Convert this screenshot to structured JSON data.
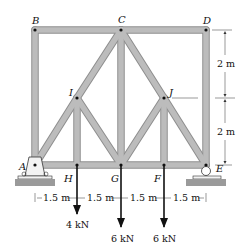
{
  "figure": {
    "type": "truss",
    "member_color": "#b3b3b3",
    "member_edge_color": "#8c8c8c",
    "joint_color": "#111111",
    "nodes": [
      {
        "id": "A",
        "label": "A"
      },
      {
        "id": "B",
        "label": "B"
      },
      {
        "id": "C",
        "label": "C"
      },
      {
        "id": "D",
        "label": "D"
      },
      {
        "id": "E",
        "label": "E"
      },
      {
        "id": "F",
        "label": "F"
      },
      {
        "id": "G",
        "label": "G"
      },
      {
        "id": "H",
        "label": "H"
      },
      {
        "id": "I",
        "label": "I"
      },
      {
        "id": "J",
        "label": "J"
      }
    ],
    "members": [
      "AB",
      "BC",
      "CD",
      "DE",
      "AH",
      "HG",
      "GF",
      "FE",
      "AI",
      "IC",
      "CJ",
      "JE",
      "IH",
      "IG",
      "CG",
      "JG",
      "JF"
    ],
    "supports": {
      "A": "pin",
      "E": "roller"
    },
    "dimensions": {
      "horizontal": [
        "1.5 m",
        "1.5 m",
        "1.5 m",
        "1.5 m"
      ],
      "vertical": [
        "2 m",
        "2 m"
      ]
    },
    "loads": [
      {
        "node": "H",
        "label": "4 kN"
      },
      {
        "node": "G",
        "label": "6 kN"
      },
      {
        "node": "F",
        "label": "6 kN"
      }
    ]
  }
}
